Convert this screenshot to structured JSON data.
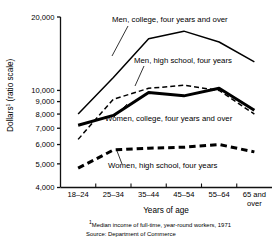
{
  "chart_data": {
    "type": "line",
    "title": "",
    "xlabel": "Years of age",
    "ylabel": "Dollars¹ (ratio scale)",
    "ylabel_main": "Dollars",
    "ylabel_sup": "1",
    "ylabel_tail": " (ratio scale)",
    "scale": "log",
    "grid": false,
    "legend_position": "inline-annotations",
    "categories": [
      "18–24",
      "25–34",
      "35–44",
      "45–54",
      "55–64",
      "65 and over"
    ],
    "categories_multiline": [
      [
        "18–24"
      ],
      [
        "25–34"
      ],
      [
        "35–44"
      ],
      [
        "45–54"
      ],
      [
        "55–64"
      ],
      [
        "65 and",
        "over"
      ]
    ],
    "ylim": [
      4000,
      20000
    ],
    "ytick_values": [
      20000,
      10000,
      9000,
      8000,
      7000,
      6000,
      5000,
      4000
    ],
    "ytick_labels": [
      "20,000",
      "10,000",
      "9,000",
      "8,000",
      "7,000",
      "6,000",
      "5,000",
      "4,000"
    ],
    "series": [
      {
        "name": "Men, college, four years and over",
        "style": "solid-thin",
        "values": [
          8000,
          11300,
          16300,
          17500,
          15800,
          13100
        ]
      },
      {
        "name": "Men, high school, four years",
        "style": "dashed-thin",
        "values": [
          6300,
          9200,
          10200,
          10500,
          10000,
          8000
        ]
      },
      {
        "name": "Women, college, four years and over",
        "style": "solid-thick",
        "values": [
          7200,
          7900,
          9800,
          9500,
          10200,
          8300
        ]
      },
      {
        "name": "Women, high school, four years",
        "style": "dashed-thick",
        "values": [
          4800,
          5700,
          5800,
          5850,
          6000,
          5600
        ]
      }
    ],
    "annotations": [
      {
        "label": "Men, college, four years and over",
        "text_x": 112,
        "text_y": 22,
        "leader_from_x": 128,
        "leader_from_y": 26,
        "leader_to_x": 112,
        "leader_to_y": 56
      },
      {
        "label": "Men, high school, four years",
        "text_x": 134,
        "text_y": 63,
        "leader_from_x": 144,
        "leader_from_y": 66,
        "leader_to_x": 135,
        "leader_to_y": 86
      },
      {
        "label": "Women, college, four years and over",
        "text_x": 105,
        "text_y": 121,
        "leader_from_x": 114,
        "leader_from_y": 117,
        "leader_to_x": 127,
        "leader_to_y": 104
      },
      {
        "label": "Women, high school, four years",
        "text_x": 108,
        "text_y": 168,
        "leader_from_x": 122,
        "leader_from_y": 164,
        "leader_to_x": 117,
        "leader_to_y": 151
      }
    ]
  },
  "footnote": {
    "marker": "1",
    "line1": "Median income of full-time, year-round workers, 1971",
    "line2": "Source:  Department of Commerce"
  }
}
